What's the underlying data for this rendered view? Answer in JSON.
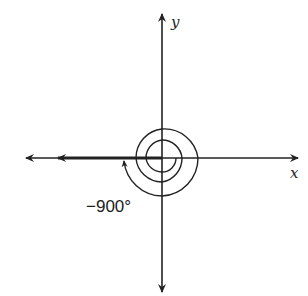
{
  "diagram": {
    "type": "coordinate-angle",
    "axes": {
      "x_label": "x",
      "y_label": "y",
      "origin": [
        162,
        158
      ]
    },
    "angle": {
      "label": "−900°",
      "degrees": -900,
      "direction": "clockwise",
      "rotations": 2.5,
      "initial_side": "positive x-axis",
      "terminal_side": "negative x-axis"
    },
    "colors": {
      "stroke": "#222222",
      "background": "#ffffff"
    }
  }
}
